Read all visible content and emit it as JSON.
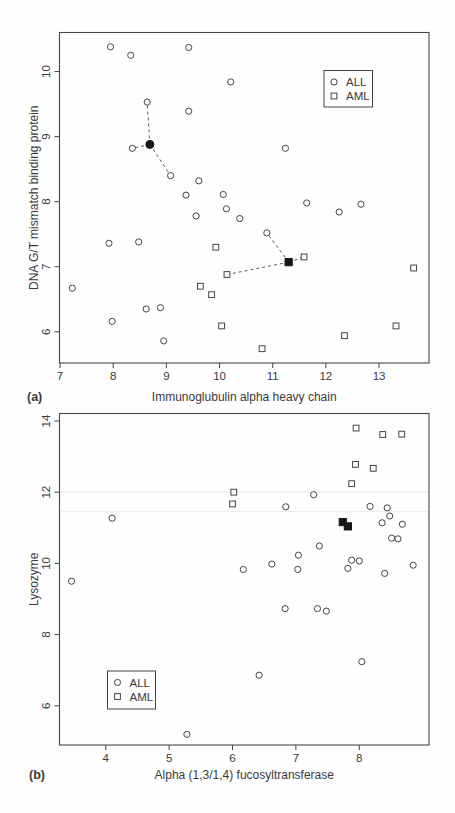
{
  "page": {
    "running_header": "CLASSIFICATION IN MICROARRAY EXPERIMENTS 223"
  },
  "chart_data": [
    {
      "type": "scatter",
      "panel_label": "(a)",
      "title": "",
      "xlabel": "Immunoglubulin alpha heavy chain",
      "ylabel": "DNA G/T mismatch binding protein",
      "xlim": [
        6.99,
        13.94
      ],
      "ylim": [
        5.52,
        10.6
      ],
      "xticks": [
        7,
        8,
        9,
        10,
        11,
        12,
        13
      ],
      "yticks": [
        6,
        7,
        8,
        9,
        10
      ],
      "grid": false,
      "legend": {
        "position": "top-right",
        "entries": [
          {
            "label": "ALL",
            "marker": "circle"
          },
          {
            "label": "AML",
            "marker": "square"
          }
        ]
      },
      "series": [
        {
          "name": "ALL",
          "marker": "circle",
          "points": [
            [
              7.95,
              10.38
            ],
            [
              8.33,
              10.25
            ],
            [
              9.42,
              10.37
            ],
            [
              10.21,
              9.84
            ],
            [
              8.64,
              9.53
            ],
            [
              9.42,
              9.39
            ],
            [
              8.36,
              8.82
            ],
            [
              11.24,
              8.82
            ],
            [
              9.08,
              8.4
            ],
            [
              9.61,
              8.32
            ],
            [
              9.37,
              8.1
            ],
            [
              10.07,
              8.11
            ],
            [
              11.64,
              7.98
            ],
            [
              12.66,
              7.96
            ],
            [
              10.13,
              7.89
            ],
            [
              9.56,
              7.78
            ],
            [
              10.38,
              7.74
            ],
            [
              12.25,
              7.84
            ],
            [
              10.89,
              7.52
            ],
            [
              7.92,
              7.36
            ],
            [
              8.48,
              7.38
            ],
            [
              7.23,
              6.67
            ],
            [
              8.62,
              6.35
            ],
            [
              8.89,
              6.37
            ],
            [
              7.98,
              6.16
            ],
            [
              8.95,
              5.86
            ]
          ]
        },
        {
          "name": "AML",
          "marker": "square",
          "points": [
            [
              9.93,
              7.3
            ],
            [
              10.14,
              6.88
            ],
            [
              11.59,
              7.15
            ],
            [
              13.65,
              6.98
            ],
            [
              9.64,
              6.7
            ],
            [
              9.85,
              6.57
            ],
            [
              10.04,
              6.09
            ],
            [
              10.8,
              5.74
            ],
            [
              12.35,
              5.94
            ],
            [
              13.32,
              6.09
            ]
          ]
        },
        {
          "name": "test-point-filled-circle",
          "marker": "filled-circle",
          "points": [
            [
              8.69,
              8.88
            ]
          ]
        },
        {
          "name": "test-point-filled-square",
          "marker": "filled-square",
          "points": [
            [
              11.3,
              7.07
            ]
          ]
        }
      ],
      "dashed_links": [
        [
          [
            8.69,
            8.88
          ],
          [
            8.64,
            9.53
          ]
        ],
        [
          [
            8.69,
            8.88
          ],
          [
            8.36,
            8.82
          ]
        ],
        [
          [
            8.69,
            8.88
          ],
          [
            9.08,
            8.4
          ]
        ],
        [
          [
            11.3,
            7.07
          ],
          [
            10.89,
            7.52
          ]
        ],
        [
          [
            11.3,
            7.07
          ],
          [
            10.14,
            6.88
          ]
        ],
        [
          [
            11.3,
            7.07
          ],
          [
            11.59,
            7.15
          ]
        ]
      ]
    },
    {
      "type": "scatter",
      "panel_label": "(b)",
      "title": "",
      "xlabel": "Alpha (1,3/1,4) fucosyltransferase",
      "ylabel": "Lysozyme",
      "xlim": [
        3.27,
        9.1
      ],
      "ylim": [
        4.9,
        14.21
      ],
      "xticks": [
        4,
        5,
        6,
        7,
        8
      ],
      "yticks": [
        6,
        8,
        10,
        12,
        14
      ],
      "grid": false,
      "legend": {
        "position": "bottom-left",
        "entries": [
          {
            "label": "ALL",
            "marker": "circle"
          },
          {
            "label": "AML",
            "marker": "square"
          }
        ]
      },
      "series": [
        {
          "name": "ALL",
          "marker": "circle",
          "points": [
            [
              3.46,
              9.5
            ],
            [
              4.1,
              11.27
            ],
            [
              5.28,
              5.2
            ],
            [
              6.17,
              9.83
            ],
            [
              6.42,
              6.86
            ],
            [
              6.62,
              9.98
            ],
            [
              6.83,
              8.73
            ],
            [
              6.84,
              11.59
            ],
            [
              7.03,
              9.83
            ],
            [
              7.04,
              10.23
            ],
            [
              7.28,
              11.93
            ],
            [
              7.34,
              8.73
            ],
            [
              7.37,
              10.49
            ],
            [
              7.48,
              8.66
            ],
            [
              7.82,
              9.86
            ],
            [
              7.88,
              10.09
            ],
            [
              8.0,
              10.07
            ],
            [
              8.04,
              7.24
            ],
            [
              8.17,
              11.6
            ],
            [
              8.4,
              9.72
            ],
            [
              8.44,
              11.56
            ],
            [
              8.48,
              11.33
            ],
            [
              8.36,
              11.14
            ],
            [
              8.68,
              11.1
            ],
            [
              8.51,
              10.71
            ],
            [
              8.61,
              10.69
            ],
            [
              8.85,
              9.95
            ]
          ]
        },
        {
          "name": "AML",
          "marker": "square",
          "points": [
            [
              6.0,
              11.67
            ],
            [
              6.02,
              12.0
            ],
            [
              7.88,
              12.24
            ],
            [
              7.94,
              12.78
            ],
            [
              8.22,
              12.67
            ],
            [
              7.95,
              13.8
            ],
            [
              8.37,
              13.62
            ],
            [
              8.67,
              13.63
            ]
          ]
        },
        {
          "name": "test-point-filled-squares",
          "marker": "filled-square",
          "points": [
            [
              7.74,
              11.16
            ],
            [
              7.82,
              11.04
            ]
          ]
        }
      ],
      "dashed_links": []
    }
  ]
}
